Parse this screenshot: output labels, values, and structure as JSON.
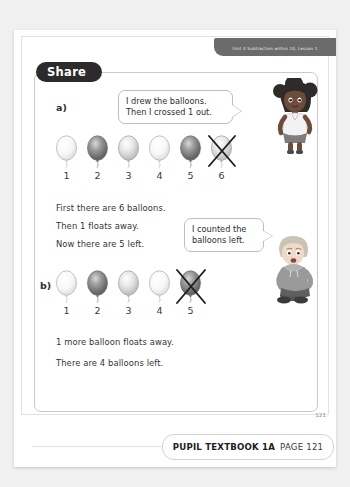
{
  "header": {
    "unit_banner": "Unit 4  Subtraction within 10, Lesson 1"
  },
  "share": {
    "pill_label": "Share"
  },
  "parts": {
    "a": {
      "label": "a)",
      "balloon_count": 6,
      "crossed_index": 6,
      "numbers": [
        "1",
        "2",
        "3",
        "4",
        "5",
        "6"
      ],
      "shades": [
        "light",
        "dark",
        "mid",
        "light",
        "dark",
        "mid"
      ],
      "sentences": [
        "First there are 6 balloons.",
        "Then 1 floats away.",
        "Now there are 5 left."
      ],
      "bubble": {
        "lines": [
          "I drew the balloons.",
          "Then I crossed 1 out."
        ]
      }
    },
    "b": {
      "label": "b)",
      "balloon_count": 5,
      "crossed_index": 5,
      "numbers": [
        "1",
        "2",
        "3",
        "4",
        "5"
      ],
      "shades": [
        "light",
        "dark",
        "mid",
        "light",
        "dark"
      ],
      "sentences": [
        "1 more balloon floats away.",
        "There are 4 balloons left."
      ],
      "bubble": {
        "lines": [
          "I counted the",
          "balloons left."
        ]
      }
    }
  },
  "characters": {
    "girl": "girl-character",
    "boy": "boy-character"
  },
  "footer": {
    "book_label": "PUPIL TEXTBOOK 1A",
    "page_label": "PAGE 121",
    "corner_page": "121"
  },
  "colors": {
    "pill_bg": "#2b2b2b",
    "banner_bg": "#6b6b6b",
    "box_border": "#c9c9c9",
    "text": "#333333"
  }
}
